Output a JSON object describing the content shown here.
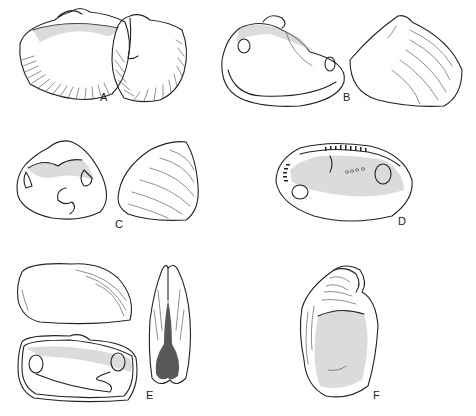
{
  "figure": {
    "background": "#ffffff",
    "ink": "#222222",
    "panels": [
      {
        "id": "A",
        "label": "A",
        "views": [
          "interior valve",
          "exterior valve with radial ribs"
        ]
      },
      {
        "id": "B",
        "label": "B",
        "views": [
          "interior valve",
          "exterior valve"
        ]
      },
      {
        "id": "C",
        "label": "C",
        "views": [
          "interior valve with pallial sinus",
          "exterior valve with concentric ridges"
        ]
      },
      {
        "id": "D",
        "label": "D",
        "views": [
          "interior valve with taxodont hinge teeth"
        ]
      },
      {
        "id": "E",
        "label": "E",
        "views": [
          "exterior valve",
          "interior valve with pallial sinus",
          "dorsal view of closed shell"
        ]
      },
      {
        "id": "F",
        "label": "F",
        "views": [
          "oyster valve, interior"
        ]
      }
    ]
  }
}
